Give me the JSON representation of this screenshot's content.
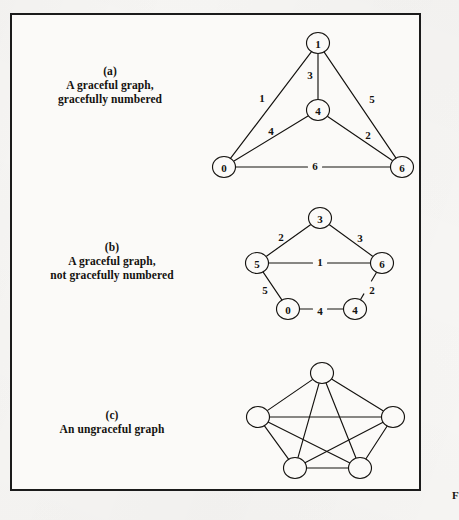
{
  "figure": {
    "background_color": "#f7f6f4",
    "frame_color": "#1b1b1b",
    "ink_color": "#14120f",
    "partial_figure_label": "F"
  },
  "panels": [
    {
      "id": "panel-a",
      "letter": "(a)",
      "caption_line1": "A graceful graph,",
      "caption_line2": "gracefully numbered",
      "graph": {
        "type": "node-link",
        "node_labels_visible": true,
        "nodes": [
          {
            "id": "a-top",
            "label": "1",
            "x": 318,
            "y": 43
          },
          {
            "id": "a-mid",
            "label": "4",
            "x": 318,
            "y": 110
          },
          {
            "id": "a-left",
            "label": "0",
            "x": 224,
            "y": 167
          },
          {
            "id": "a-right",
            "label": "6",
            "x": 402,
            "y": 167
          }
        ],
        "edges": [
          {
            "from": "a-top",
            "to": "a-left",
            "label": "1",
            "lx": 262,
            "ly": 98
          },
          {
            "from": "a-top",
            "to": "a-mid",
            "label": "3",
            "lx": 310,
            "ly": 75
          },
          {
            "from": "a-top",
            "to": "a-right",
            "label": "5",
            "lx": 372,
            "ly": 99
          },
          {
            "from": "a-mid",
            "to": "a-left",
            "label": "4",
            "lx": 271,
            "ly": 131
          },
          {
            "from": "a-mid",
            "to": "a-right",
            "label": "2",
            "lx": 368,
            "ly": 135
          },
          {
            "from": "a-left",
            "to": "a-right",
            "label": "6",
            "lx": 315,
            "ly": 166
          }
        ]
      }
    },
    {
      "id": "panel-b",
      "letter": "(b)",
      "caption_line1": "A graceful graph,",
      "caption_line2": "not gracefully numbered",
      "graph": {
        "type": "node-link",
        "node_labels_visible": true,
        "nodes": [
          {
            "id": "b-top",
            "label": "3",
            "x": 320,
            "y": 218
          },
          {
            "id": "b-left",
            "label": "5",
            "x": 257,
            "y": 263
          },
          {
            "id": "b-right",
            "label": "6",
            "x": 382,
            "y": 263
          },
          {
            "id": "b-bottomleft",
            "label": "0",
            "x": 288,
            "y": 309
          },
          {
            "id": "b-bottomright",
            "label": "4",
            "x": 355,
            "y": 309
          }
        ],
        "edges": [
          {
            "from": "b-top",
            "to": "b-left",
            "label": "2",
            "lx": 281,
            "ly": 237
          },
          {
            "from": "b-top",
            "to": "b-right",
            "label": "3",
            "lx": 360,
            "ly": 238
          },
          {
            "from": "b-left",
            "to": "b-right",
            "label": "1",
            "lx": 320,
            "ly": 262
          },
          {
            "from": "b-left",
            "to": "b-bottomleft",
            "label": "5",
            "lx": 265,
            "ly": 290
          },
          {
            "from": "b-right",
            "to": "b-bottomright",
            "label": "2",
            "lx": 372,
            "ly": 290
          },
          {
            "from": "b-bottomleft",
            "to": "b-bottomright",
            "label": "4",
            "lx": 320,
            "ly": 311
          }
        ]
      }
    },
    {
      "id": "panel-c",
      "letter": "(c)",
      "caption_line1": "An ungraceful graph",
      "caption_line2": "",
      "graph": {
        "type": "node-link",
        "node_labels_visible": false,
        "nodes": [
          {
            "id": "c-top",
            "label": "",
            "x": 322,
            "y": 373
          },
          {
            "id": "c-left",
            "label": "",
            "x": 258,
            "y": 417
          },
          {
            "id": "c-right",
            "label": "",
            "x": 393,
            "y": 417
          },
          {
            "id": "c-bottomleft",
            "label": "",
            "x": 295,
            "y": 468
          },
          {
            "id": "c-bottomright",
            "label": "",
            "x": 360,
            "y": 468
          }
        ],
        "edges": [
          {
            "from": "c-top",
            "to": "c-left",
            "label": "",
            "lx": 0,
            "ly": 0
          },
          {
            "from": "c-top",
            "to": "c-right",
            "label": "",
            "lx": 0,
            "ly": 0
          },
          {
            "from": "c-top",
            "to": "c-bottomleft",
            "label": "",
            "lx": 0,
            "ly": 0
          },
          {
            "from": "c-top",
            "to": "c-bottomright",
            "label": "",
            "lx": 0,
            "ly": 0
          },
          {
            "from": "c-left",
            "to": "c-right",
            "label": "",
            "lx": 0,
            "ly": 0
          },
          {
            "from": "c-left",
            "to": "c-bottomleft",
            "label": "",
            "lx": 0,
            "ly": 0
          },
          {
            "from": "c-left",
            "to": "c-bottomright",
            "label": "",
            "lx": 0,
            "ly": 0
          },
          {
            "from": "c-right",
            "to": "c-bottomleft",
            "label": "",
            "lx": 0,
            "ly": 0
          },
          {
            "from": "c-right",
            "to": "c-bottomright",
            "label": "",
            "lx": 0,
            "ly": 0
          },
          {
            "from": "c-bottomleft",
            "to": "c-bottomright",
            "label": "",
            "lx": 0,
            "ly": 0
          }
        ]
      }
    }
  ],
  "captions": {
    "a": {
      "x": 40,
      "y": 64
    },
    "b": {
      "x": 28,
      "y": 240
    },
    "c": {
      "x": 50,
      "y": 408
    }
  }
}
